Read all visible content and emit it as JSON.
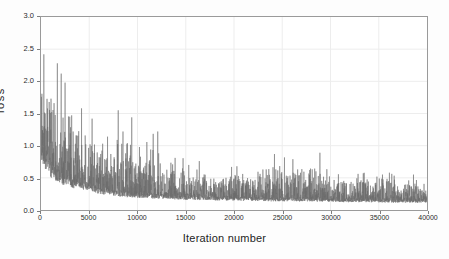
{
  "chart_data": {
    "type": "line",
    "title": "",
    "subtitle": "",
    "xlabel": "Iteration number",
    "ylabel": "loss",
    "xlim": [
      0,
      40000
    ],
    "ylim": [
      0,
      3.0
    ],
    "xticks": [
      0,
      5000,
      10000,
      15000,
      20000,
      25000,
      30000,
      35000,
      40000
    ],
    "xtick_labels": [
      "0",
      "5000",
      "10000",
      "15000",
      "20000",
      "25000",
      "30000",
      "35000",
      "40000"
    ],
    "yticks": [
      0.0,
      0.5,
      1.0,
      1.5,
      2.0,
      2.5,
      3.0
    ],
    "ytick_labels": [
      "0.0",
      "0.5",
      "1.0",
      "1.5",
      "2.0",
      "2.5",
      "3.0"
    ],
    "grid": true,
    "legend": null,
    "legend_position": "none",
    "series": [
      {
        "name": "loss",
        "color": "#6a6a6a",
        "linewidth": 0.5,
        "description": "Noisy per-iteration training loss decaying from about 2.4 near iteration 0 to a steady band around 0.10-0.25 after iteration 30000, with sparse upward spikes throughout.",
        "envelope": {
          "x": [
            0,
            1000,
            2000,
            3000,
            4000,
            5000,
            6000,
            7000,
            8000,
            9000,
            10000,
            12000,
            14000,
            16000,
            18000,
            20000,
            22000,
            24000,
            26000,
            28000,
            30000,
            32000,
            34000,
            36000,
            38000,
            40000
          ],
          "upper": [
            2.42,
            2.3,
            2.28,
            1.95,
            1.6,
            1.43,
            1.15,
            1.1,
            1.55,
            1.45,
            1.0,
            1.25,
            0.82,
            0.78,
            0.62,
            0.7,
            0.58,
            0.88,
            0.8,
            0.9,
            0.6,
            0.55,
            0.62,
            0.58,
            0.55,
            0.5
          ],
          "mean": [
            1.05,
            0.72,
            0.58,
            0.5,
            0.45,
            0.42,
            0.36,
            0.32,
            0.3,
            0.28,
            0.26,
            0.25,
            0.23,
            0.22,
            0.21,
            0.2,
            0.2,
            0.19,
            0.19,
            0.18,
            0.18,
            0.17,
            0.17,
            0.16,
            0.16,
            0.16
          ],
          "lower": [
            0.18,
            0.1,
            0.08,
            0.06,
            0.05,
            0.04,
            0.04,
            0.04,
            0.03,
            0.03,
            0.03,
            0.03,
            0.03,
            0.03,
            0.03,
            0.02,
            0.02,
            0.02,
            0.02,
            0.02,
            0.02,
            0.02,
            0.02,
            0.02,
            0.02,
            0.02
          ]
        },
        "notable_spikes": [
          {
            "x": 300,
            "y": 2.42
          },
          {
            "x": 1700,
            "y": 2.28
          },
          {
            "x": 2100,
            "y": 2.12
          },
          {
            "x": 2500,
            "y": 1.98
          },
          {
            "x": 4200,
            "y": 1.58
          },
          {
            "x": 5300,
            "y": 1.42
          },
          {
            "x": 6900,
            "y": 1.14
          },
          {
            "x": 8000,
            "y": 1.55
          },
          {
            "x": 9400,
            "y": 1.44
          },
          {
            "x": 12100,
            "y": 1.22
          },
          {
            "x": 13900,
            "y": 0.81
          },
          {
            "x": 16400,
            "y": 0.76
          },
          {
            "x": 20300,
            "y": 0.68
          },
          {
            "x": 24200,
            "y": 0.87
          },
          {
            "x": 26100,
            "y": 0.79
          },
          {
            "x": 28900,
            "y": 0.89
          },
          {
            "x": 33400,
            "y": 0.57
          },
          {
            "x": 36100,
            "y": 0.58
          },
          {
            "x": 38600,
            "y": 0.55
          }
        ]
      }
    ]
  },
  "axes": {
    "x_title": "Iteration number",
    "y_title": "loss"
  }
}
